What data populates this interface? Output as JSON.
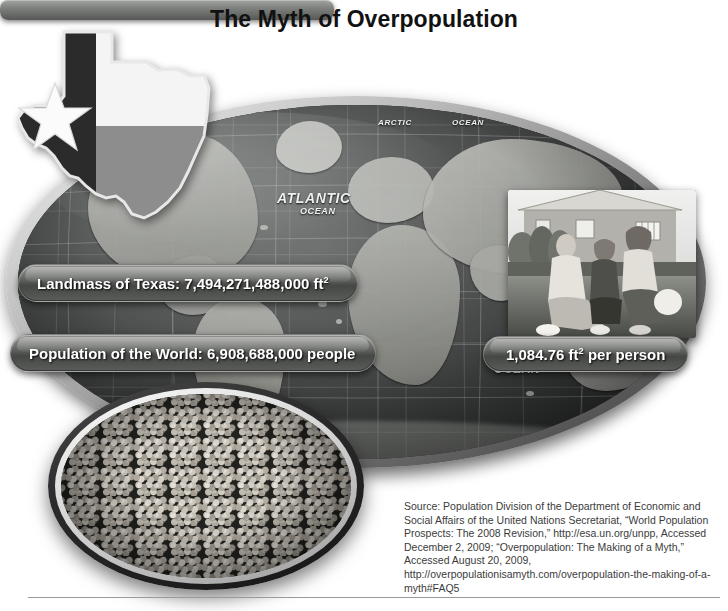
{
  "poster": {
    "title": "The Myth of Overpopulation"
  },
  "map": {
    "labels": {
      "arctic": "ARCTIC",
      "arctic_ocean": "OCEAN",
      "atlantic": "ATLANTIC",
      "atlantic_ocean": "OCEAN",
      "indian_ocean": "OCEAN"
    }
  },
  "banners": {
    "landmass": {
      "prefix": "Landmass of Texas: 7,494,271,488,000 ft",
      "unit_exponent": "2"
    },
    "population": {
      "text": "Population of the World: 6,908,688,000 people"
    },
    "per_person": {
      "prefix": "1,084.76 ft",
      "unit_exponent": "2",
      "suffix": " per person"
    }
  },
  "images": {
    "texas_flag": "texas-state-flag-shape",
    "family_photo": "family-of-three-in-front-of-house",
    "crowd_photo": "dense-crowd-of-people"
  },
  "source": {
    "text": "Source: Population Division of the Department of Economic and Social Affairs of the United Nations Secretariat, “World Population Prospects: The 2008 Revision,” http://esa.un.org/unpp, Accessed December 2, 2009; “Overpopulation: The Making of a Myth,” Accessed August 20, 2009, http://overpopulationisamyth.com/overpopulation-the-making-of-a-myth#FAQ5"
  },
  "colors": {
    "title": "#111111",
    "banner_text": "#ffffff",
    "source_text": "#3b3b3b",
    "rule": "#9a9a9a",
    "page_background": "#ffffff"
  }
}
